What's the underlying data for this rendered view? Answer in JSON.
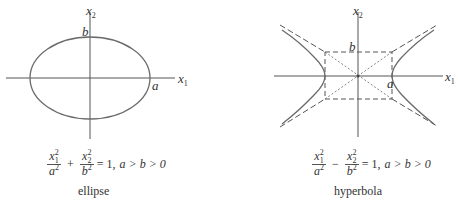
{
  "ellipse": {
    "axis_labels": {
      "x1": "x",
      "x1_sub": "1",
      "x2": "x",
      "x2_sub": "2"
    },
    "point_labels": {
      "a": "a",
      "b": "b"
    },
    "equation": {
      "term1_num": "x",
      "term1_num_sub": "1",
      "term1_num_sup": "2",
      "term1_den": "a",
      "term1_den_sup": "2",
      "operator": "+",
      "term2_num": "x",
      "term2_num_sub": "2",
      "term2_num_sup": "2",
      "term2_den": "b",
      "term2_den_sup": "2",
      "rhs": "= 1,",
      "condition": "a > b > 0"
    },
    "caption": "ellipse"
  },
  "hyperbola": {
    "axis_labels": {
      "x1": "x",
      "x1_sub": "1",
      "x2": "x",
      "x2_sub": "2"
    },
    "point_labels": {
      "a": "a",
      "b": "b"
    },
    "equation": {
      "term1_num": "x",
      "term1_num_sub": "1",
      "term1_num_sup": "2",
      "term1_den": "a",
      "term1_den_sup": "2",
      "operator": "−",
      "term2_num": "x",
      "term2_num_sub": "2",
      "term2_num_sup": "2",
      "term2_den": "b",
      "term2_den_sup": "2",
      "rhs": "= 1,",
      "condition": "a > b > 0"
    },
    "caption": "hyperbola"
  },
  "colors": {
    "curve": "#6a6a6a",
    "axis": "#555555",
    "text": "#333333"
  }
}
